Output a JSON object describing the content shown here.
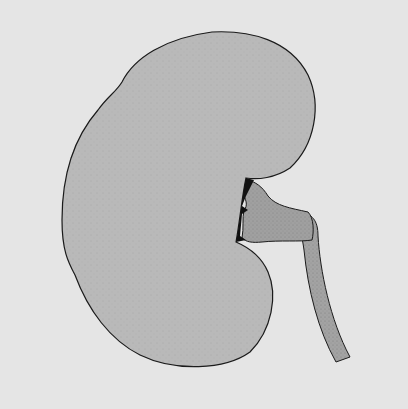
{
  "figure": {
    "parts": [
      "kidney",
      "renal-pelvis",
      "ureter"
    ],
    "colors": {
      "background": "#e5e5e5",
      "kidney_fill": "#b9b9b9",
      "pelvis_fill": "#9e9e9e",
      "outline": "#1a1a1a"
    }
  }
}
